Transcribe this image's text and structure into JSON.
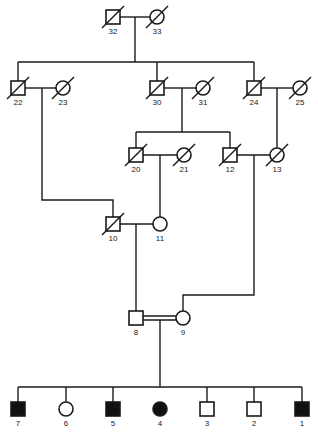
{
  "diagram": {
    "type": "pedigree",
    "colors": {
      "line": "#1a1a1a",
      "affected_fill": "#111111",
      "unaffected_fill": "#ffffff"
    },
    "individuals": [
      {
        "id": "32",
        "sex": "male",
        "deceased": true,
        "affected": false,
        "generation": 1
      },
      {
        "id": "33",
        "sex": "female",
        "deceased": true,
        "affected": false,
        "generation": 1
      },
      {
        "id": "22",
        "sex": "male",
        "deceased": true,
        "affected": false,
        "generation": 2
      },
      {
        "id": "23",
        "sex": "female",
        "deceased": true,
        "affected": false,
        "generation": 2
      },
      {
        "id": "30",
        "sex": "male",
        "deceased": true,
        "affected": false,
        "generation": 2
      },
      {
        "id": "31",
        "sex": "female",
        "deceased": true,
        "affected": false,
        "generation": 2
      },
      {
        "id": "24",
        "sex": "male",
        "deceased": true,
        "affected": false,
        "generation": 2
      },
      {
        "id": "25",
        "sex": "female",
        "deceased": true,
        "affected": false,
        "generation": 2
      },
      {
        "id": "20",
        "sex": "male",
        "deceased": true,
        "affected": false,
        "generation": 3
      },
      {
        "id": "21",
        "sex": "female",
        "deceased": true,
        "affected": false,
        "generation": 3
      },
      {
        "id": "12",
        "sex": "male",
        "deceased": true,
        "affected": false,
        "generation": 3
      },
      {
        "id": "13",
        "sex": "female",
        "deceased": true,
        "affected": false,
        "generation": 3
      },
      {
        "id": "10",
        "sex": "male",
        "deceased": true,
        "affected": false,
        "generation": 4
      },
      {
        "id": "11",
        "sex": "female",
        "deceased": false,
        "affected": false,
        "generation": 4
      },
      {
        "id": "8",
        "sex": "male",
        "deceased": false,
        "affected": false,
        "generation": 5
      },
      {
        "id": "9",
        "sex": "female",
        "deceased": false,
        "affected": false,
        "generation": 5
      },
      {
        "id": "7",
        "sex": "male",
        "deceased": false,
        "affected": true,
        "generation": 6
      },
      {
        "id": "6",
        "sex": "female",
        "deceased": false,
        "affected": false,
        "generation": 6
      },
      {
        "id": "5",
        "sex": "male",
        "deceased": false,
        "affected": true,
        "generation": 6
      },
      {
        "id": "4",
        "sex": "female",
        "deceased": false,
        "affected": true,
        "generation": 6
      },
      {
        "id": "3",
        "sex": "male",
        "deceased": false,
        "affected": false,
        "generation": 6
      },
      {
        "id": "2",
        "sex": "male",
        "deceased": false,
        "affected": false,
        "generation": 6
      },
      {
        "id": "1",
        "sex": "male",
        "deceased": false,
        "affected": true,
        "generation": 6
      }
    ],
    "unions": [
      {
        "partners": [
          "32",
          "33"
        ],
        "children": [
          "22",
          "30",
          "24"
        ],
        "consanguineous": false
      },
      {
        "partners": [
          "22",
          "23"
        ],
        "children": [
          "10"
        ],
        "consanguineous": false
      },
      {
        "partners": [
          "30",
          "31"
        ],
        "children": [
          "20",
          "12"
        ],
        "consanguineous": false
      },
      {
        "partners": [
          "24",
          "25"
        ],
        "children": [
          "13"
        ],
        "consanguineous": false
      },
      {
        "partners": [
          "20",
          "21"
        ],
        "children": [
          "11"
        ],
        "consanguineous": false
      },
      {
        "partners": [
          "12",
          "13"
        ],
        "children": [
          "9"
        ],
        "consanguineous": false
      },
      {
        "partners": [
          "10",
          "11"
        ],
        "children": [
          "8"
        ],
        "consanguineous": false
      },
      {
        "partners": [
          "8",
          "9"
        ],
        "children": [
          "7",
          "6",
          "5",
          "4",
          "3",
          "2",
          "1"
        ],
        "consanguineous": true
      }
    ],
    "labels": {
      "i32": "32",
      "i33": "33",
      "i22": "22",
      "i23": "23",
      "i30": "30",
      "i31": "31",
      "i24": "24",
      "i25": "25",
      "i20": "20",
      "i21": "21",
      "i12": "12",
      "i13": "13",
      "i10": "10",
      "i11": "11",
      "i8": "8",
      "i9": "9",
      "i7": "7",
      "i6": "6",
      "i5": "5",
      "i4": "4",
      "i3": "3",
      "i2": "2",
      "i1": "1"
    }
  }
}
